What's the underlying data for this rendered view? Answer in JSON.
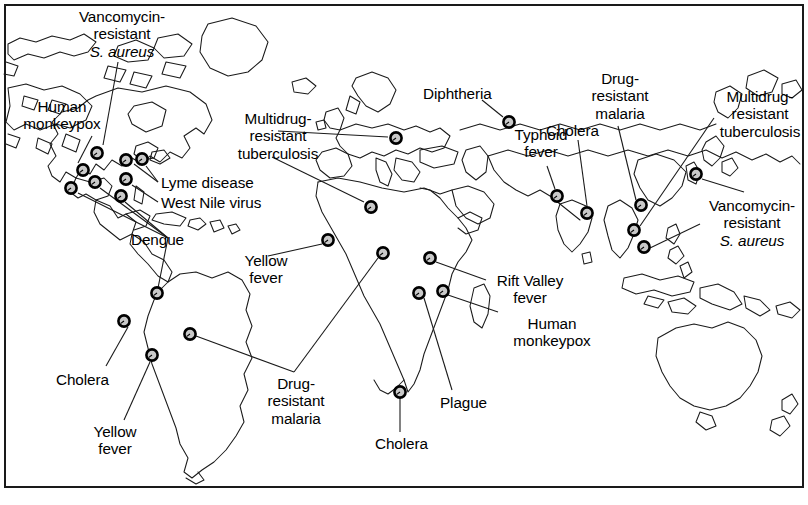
{
  "figure": {
    "frame_color": "#1a1a1a",
    "land_outline_color": "#1a1a1a",
    "marker_fill_color": "#c9c9c9",
    "marker_stroke_color": "#000000",
    "background_color": "#ffffff"
  },
  "chart_data": {
    "type": "map",
    "projection": "world-equirectangular",
    "grid": false,
    "legend": "none",
    "marker_count": 24,
    "label_count": 20,
    "diseases": [
      "Vancomycin-resistant S. aureus",
      "Human monkeypox",
      "Multidrug-resistant tuberculosis",
      "Lyme disease",
      "West Nile virus",
      "Dengue",
      "Diphtheria",
      "Typhoid fever",
      "Cholera",
      "Drug-resistant malaria",
      "Yellow fever",
      "Rift Valley fever",
      "Plague"
    ]
  },
  "labels": [
    {
      "id": "vancomycin-usa",
      "disease": "Vancomycin-resistant S. aureus",
      "line1": "Vancomycin-",
      "line2": "resistant",
      "line3": "S. aureus",
      "italic_line": 3,
      "align": "center",
      "x": 48,
      "y": 8,
      "width": 148
    },
    {
      "id": "human-monkeypox-usa",
      "disease": "Human monkeypox",
      "line1": "Human",
      "line2": "monkeypox",
      "line3": "",
      "italic_line": 0,
      "align": "center",
      "x": 10,
      "y": 98,
      "width": 104
    },
    {
      "id": "mdr-tb-europe",
      "disease": "Multidrug-resistant tuberculosis",
      "line1": "Multidrug-",
      "line2": "resistant",
      "line3": "tuberculosis",
      "italic_line": 0,
      "align": "center",
      "x": 224,
      "y": 110,
      "width": 108
    },
    {
      "id": "lyme-disease",
      "disease": "Lyme disease",
      "line1": "Lyme disease",
      "line2": "",
      "line3": "",
      "italic_line": 0,
      "align": "left",
      "x": 161,
      "y": 174,
      "width": 116
    },
    {
      "id": "west-nile-virus",
      "disease": "West Nile virus",
      "line1": "West Nile virus",
      "line2": "",
      "line3": "",
      "italic_line": 0,
      "align": "left",
      "x": 161,
      "y": 194,
      "width": 126
    },
    {
      "id": "dengue",
      "disease": "Dengue",
      "line1": "Dengue",
      "line2": "",
      "line3": "",
      "italic_line": 0,
      "align": "left",
      "x": 131,
      "y": 231,
      "width": 70
    },
    {
      "id": "diphtheria",
      "disease": "Diphtheria",
      "line1": "Diphtheria",
      "line2": "",
      "line3": "",
      "italic_line": 0,
      "align": "left",
      "x": 423,
      "y": 85,
      "width": 84
    },
    {
      "id": "typhoid-fever",
      "disease": "Typhoid fever",
      "line1": "Typhoid",
      "line2": "fever",
      "line3": "",
      "italic_line": 0,
      "align": "center",
      "x": 505,
      "y": 126,
      "width": 72
    },
    {
      "id": "cholera-india",
      "disease": "Cholera",
      "line1": "Cholera",
      "line2": "",
      "line3": "",
      "italic_line": 0,
      "align": "left",
      "x": 546,
      "y": 122,
      "width": 70
    },
    {
      "id": "drug-resistant-malaria-asia",
      "disease": "Drug-resistant malaria",
      "line1": "Drug-",
      "line2": "resistant",
      "line3": "malaria",
      "italic_line": 0,
      "align": "center",
      "x": 578,
      "y": 70,
      "width": 84
    },
    {
      "id": "mdr-tb-asia",
      "disease": "Multidrug-resistant tuberculosis",
      "line1": "Multidrug-",
      "line2": "resistant",
      "line3": "tuberculosis",
      "italic_line": 0,
      "align": "center",
      "x": 712,
      "y": 88,
      "width": 96
    },
    {
      "id": "vancomycin-asia",
      "disease": "Vancomycin-resistant S. aureus",
      "line1": "Vancomycin-",
      "line2": "resistant",
      "line3": "S. aureus",
      "italic_line": 3,
      "align": "center",
      "x": 700,
      "y": 197,
      "width": 104
    },
    {
      "id": "yellow-fever-africa",
      "disease": "Yellow fever",
      "line1": "Yellow",
      "line2": "fever",
      "line3": "",
      "italic_line": 0,
      "align": "center",
      "x": 232,
      "y": 252,
      "width": 68
    },
    {
      "id": "rift-valley-fever",
      "disease": "Rift Valley fever",
      "line1": "Rift Valley",
      "line2": "fever",
      "line3": "",
      "italic_line": 0,
      "align": "center",
      "x": 489,
      "y": 272,
      "width": 82
    },
    {
      "id": "human-monkeypox-africa",
      "disease": "Human monkeypox",
      "line1": "Human",
      "line2": "monkeypox",
      "line3": "",
      "italic_line": 0,
      "align": "center",
      "x": 500,
      "y": 315,
      "width": 104
    },
    {
      "id": "cholera-peru",
      "disease": "Cholera",
      "line1": "Cholera",
      "line2": "",
      "line3": "",
      "italic_line": 0,
      "align": "left",
      "x": 56,
      "y": 371,
      "width": 70
    },
    {
      "id": "drug-resistant-malaria-africa",
      "disease": "Drug-resistant malaria",
      "line1": "Drug-",
      "line2": "resistant",
      "line3": "malaria",
      "italic_line": 0,
      "align": "center",
      "x": 254,
      "y": 375,
      "width": 84
    },
    {
      "id": "plague",
      "disease": "Plague",
      "line1": "Plague",
      "line2": "",
      "line3": "",
      "italic_line": 0,
      "align": "left",
      "x": 440,
      "y": 394,
      "width": 64
    },
    {
      "id": "yellow-fever-samerica",
      "disease": "Yellow fever",
      "line1": "Yellow",
      "line2": "fever",
      "line3": "",
      "italic_line": 0,
      "align": "center",
      "x": 81,
      "y": 423,
      "width": 68
    },
    {
      "id": "cholera-africa",
      "disease": "Cholera",
      "line1": "Cholera",
      "line2": "",
      "line3": "",
      "italic_line": 0,
      "align": "left",
      "x": 375,
      "y": 435,
      "width": 70
    }
  ],
  "markers": [
    {
      "id": "m-vrsa-usa",
      "disease": "Vancomycin-resistant S. aureus",
      "x": 97,
      "y": 153
    },
    {
      "id": "m-monkeypox-usa",
      "disease": "Human monkeypox",
      "x": 83,
      "y": 170
    },
    {
      "id": "m-dengue-a",
      "disease": "Dengue",
      "x": 71,
      "y": 188
    },
    {
      "id": "m-dengue-b",
      "disease": "Dengue",
      "x": 95,
      "y": 182
    },
    {
      "id": "m-lyme-a",
      "disease": "Lyme disease",
      "x": 126,
      "y": 160
    },
    {
      "id": "m-lyme-b",
      "disease": "Lyme disease",
      "x": 142,
      "y": 159
    },
    {
      "id": "m-westnile",
      "disease": "West Nile virus",
      "x": 126,
      "y": 179
    },
    {
      "id": "m-dengue-c",
      "disease": "Dengue",
      "x": 121,
      "y": 196
    },
    {
      "id": "m-mdrtb-europe",
      "disease": "Multidrug-resistant tuberculosis",
      "x": 396,
      "y": 138
    },
    {
      "id": "m-mdrtb-nafrica",
      "disease": "Multidrug-resistant tuberculosis",
      "x": 371,
      "y": 207
    },
    {
      "id": "m-diphtheria",
      "disease": "Diphtheria",
      "x": 509,
      "y": 122
    },
    {
      "id": "m-typhoid",
      "disease": "Typhoid fever",
      "x": 557,
      "y": 196
    },
    {
      "id": "m-cholera-india",
      "disease": "Cholera",
      "x": 587,
      "y": 213
    },
    {
      "id": "m-drmalaria-asia",
      "disease": "Drug-resistant malaria",
      "x": 641,
      "y": 205
    },
    {
      "id": "m-vrsa-asia-a",
      "disease": "Vancomycin-resistant S. aureus",
      "x": 696,
      "y": 174
    },
    {
      "id": "m-mdrtb-asia",
      "disease": "Multidrug-resistant tuberculosis",
      "x": 634,
      "y": 230
    },
    {
      "id": "m-vrsa-asia-b",
      "disease": "Vancomycin-resistant S. aureus",
      "x": 644,
      "y": 247
    },
    {
      "id": "m-yellowfever-afr",
      "disease": "Yellow fever",
      "x": 328,
      "y": 240
    },
    {
      "id": "m-drmalaria-afr",
      "disease": "Drug-resistant malaria",
      "x": 383,
      "y": 253
    },
    {
      "id": "m-riftvalley",
      "disease": "Rift Valley fever",
      "x": 430,
      "y": 258
    },
    {
      "id": "m-plague",
      "disease": "Plague",
      "x": 419,
      "y": 293
    },
    {
      "id": "m-monkeypox-afr",
      "disease": "Human monkeypox",
      "x": 443,
      "y": 291
    },
    {
      "id": "m-cholera-africa",
      "disease": "Cholera",
      "x": 400,
      "y": 392
    },
    {
      "id": "m-dengue-samer",
      "disease": "Dengue",
      "x": 157,
      "y": 293
    },
    {
      "id": "m-cholera-peru",
      "disease": "Cholera",
      "x": 124,
      "y": 321
    },
    {
      "id": "m-yellowfever-sa",
      "disease": "Yellow fever",
      "x": 152,
      "y": 355
    },
    {
      "id": "m-drmalaria-sa",
      "disease": "Drug-resistant malaria",
      "x": 190,
      "y": 334
    }
  ]
}
